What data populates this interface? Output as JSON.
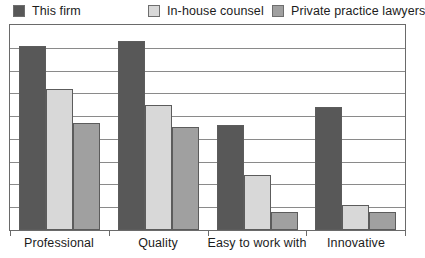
{
  "chart_data": {
    "type": "bar",
    "title": "",
    "subtitle": "",
    "xlabel": "",
    "ylabel": "",
    "ylim": [
      0,
      8
    ],
    "grid": true,
    "gridline_count": 9,
    "legend_position": "top",
    "categories": [
      "Professional",
      "Quality",
      "Easy to work with",
      "Innovative"
    ],
    "series": [
      {
        "name": "This firm",
        "color": "#585858",
        "values": [
          8.1,
          8.3,
          4.6,
          5.4
        ]
      },
      {
        "name": "In-house counsel",
        "color": "#d8d8d8",
        "values": [
          6.2,
          5.5,
          2.4,
          1.1
        ]
      },
      {
        "name": "Private practice lawyers",
        "color": "#a0a0a0",
        "values": [
          4.7,
          4.5,
          0.8,
          0.8
        ]
      }
    ],
    "axis_max_value": 9.0
  },
  "legend": {
    "items": [
      {
        "label": "This firm",
        "color": "#585858"
      },
      {
        "label": "In-house counsel",
        "color": "#d8d8d8"
      },
      {
        "label": "Private practice lawyers",
        "color": "#a0a0a0"
      }
    ]
  },
  "axis": {
    "categories": [
      {
        "label": "Professional"
      },
      {
        "label": "Quality"
      },
      {
        "label": "Easy to work with"
      },
      {
        "label": "Innovative"
      }
    ]
  },
  "colors": {
    "series_1": "#585858",
    "series_2": "#d8d8d8",
    "series_3": "#a0a0a0",
    "frame": "#6a6a6a",
    "gridline": "#8a8a8a",
    "text": "#1c1c1c",
    "background": "#ffffff"
  }
}
